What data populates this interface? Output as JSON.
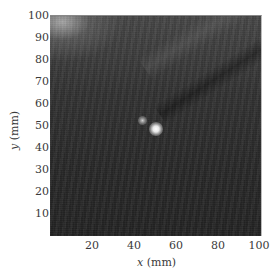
{
  "figure": {
    "type": "grayscale-intensity-image",
    "x_axis": {
      "variable": "x",
      "unit": "(mm)",
      "range": [
        0,
        100
      ],
      "ticks": [
        "20",
        "40",
        "60",
        "80",
        "100"
      ]
    },
    "y_axis": {
      "variable": "y",
      "unit": "(mm)",
      "range": [
        0,
        100
      ],
      "ticks": [
        "10",
        "20",
        "30",
        "40",
        "50",
        "60",
        "70",
        "80",
        "90",
        "100"
      ]
    },
    "features": [
      {
        "name": "bright-spot-main",
        "x_mm": 52,
        "y_mm": 47
      },
      {
        "name": "bright-spot-secondary",
        "x_mm": 46,
        "y_mm": 51
      },
      {
        "name": "bright-region-top-left",
        "x_mm": 5,
        "y_mm": 98
      },
      {
        "name": "diagonal-streak",
        "from_mm": [
          50,
          50
        ],
        "to_mm": [
          100,
          75
        ]
      }
    ],
    "colors": {
      "background": "#2c2c2c",
      "highlight": "#ffffff",
      "text": "#3a3a3a"
    }
  }
}
